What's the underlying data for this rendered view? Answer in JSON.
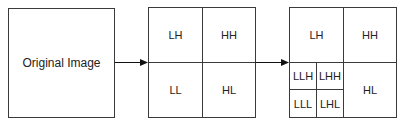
{
  "diagram": {
    "original": {
      "label": "Original Image"
    },
    "level1": {
      "quadrants": {
        "top_left": "LH",
        "top_right": "HH",
        "bottom_left": "LL",
        "bottom_right": "HL"
      }
    },
    "level2": {
      "quadrants": {
        "top_left": "LH",
        "top_right": "HH",
        "bottom_right": "HL"
      },
      "sub_quadrants": {
        "top_left": "LLH",
        "top_right": "LHH",
        "bottom_left": "LLL",
        "bottom_right": "LHL"
      }
    },
    "colors": {
      "line": "#3a3a3a",
      "background": "#ffffff"
    }
  }
}
